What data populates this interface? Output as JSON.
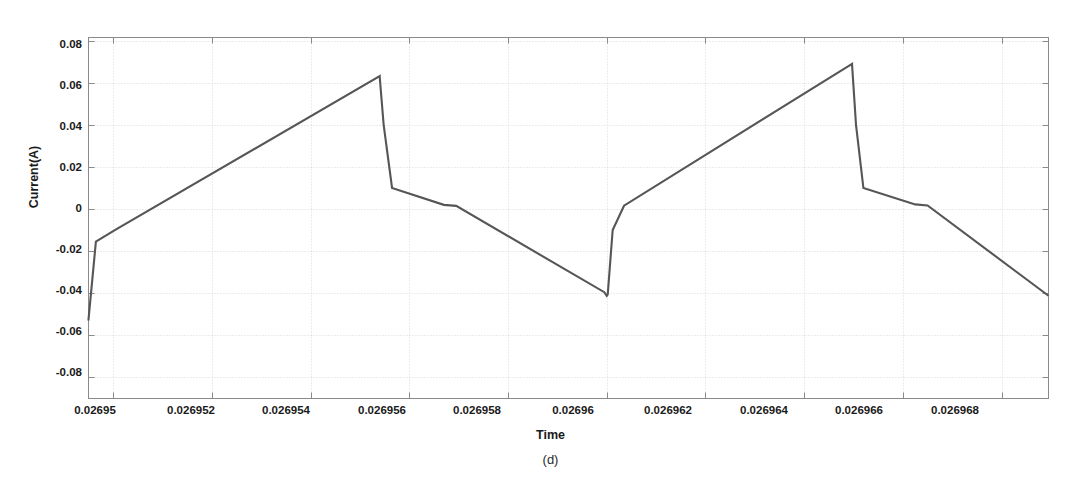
{
  "figure": {
    "caption": "(d)",
    "background_color": "#ffffff"
  },
  "chart_data": {
    "type": "line",
    "title": "",
    "subtitle": "",
    "xlabel": "Time",
    "ylabel": "Current(A)",
    "xlim": [
      0.0269495,
      0.02696895
    ],
    "ylim": [
      -0.09,
      0.0815
    ],
    "grid": true,
    "legend": null,
    "line_color": "#565656",
    "grid_color": "#cfcfcf",
    "axis_color": "#8a8a8a",
    "xticks": [
      0.02695,
      0.026952,
      0.026954,
      0.026956,
      0.026958,
      0.02696,
      0.026962,
      0.026964,
      0.026966,
      0.026968
    ],
    "xtick_labels": [
      "0.02695",
      "0.026952",
      "0.026954",
      "0.026956",
      "0.026958",
      "0.02696",
      "0.026962",
      "0.026964",
      "0.026966",
      "0.026968"
    ],
    "yticks": [
      0.08,
      0.06,
      0.04,
      0.02,
      0,
      -0.02,
      -0.04,
      -0.06,
      -0.08
    ],
    "ytick_labels": [
      "0.08",
      "0.06",
      "0.04",
      "0.02",
      "0",
      "-0.02",
      "-0.04",
      "-0.06",
      "-0.08"
    ],
    "series": [
      {
        "name": "current",
        "x": [
          0.0269495,
          0.0269495,
          0.02694965,
          0.02695005,
          0.0269554,
          0.0269554,
          0.02695548,
          0.02695565,
          0.0269567,
          0.02695695,
          0.02695995,
          0.02696,
          0.02696002,
          0.02696012,
          0.02696035,
          0.02696497,
          0.02696497,
          0.02696505,
          0.0269652,
          0.02696625,
          0.0269665,
          0.02696895
        ],
        "y": [
          -0.053,
          -0.0525,
          -0.0155,
          -0.0098,
          0.0632,
          0.0628,
          0.04,
          0.01,
          0.002,
          0.0015,
          -0.0395,
          -0.0412,
          -0.0405,
          -0.01,
          0.0016,
          0.069,
          0.0686,
          0.04,
          0.01,
          0.0022,
          0.0017,
          -0.0412
        ]
      }
    ],
    "annotations": [
      {
        "label": "initial-vertical-transient",
        "x": 0.0269495,
        "y_from": -0.053,
        "y_to": -0.0098
      },
      {
        "label": "peak-1",
        "x": 0.0269554,
        "y": 0.0632
      },
      {
        "label": "trough-1",
        "x": 0.02696,
        "y": -0.0412
      },
      {
        "label": "peak-2",
        "x": 0.02696497,
        "y": 0.069
      },
      {
        "label": "end-value",
        "x": 0.02696895,
        "y": -0.0412
      }
    ]
  }
}
